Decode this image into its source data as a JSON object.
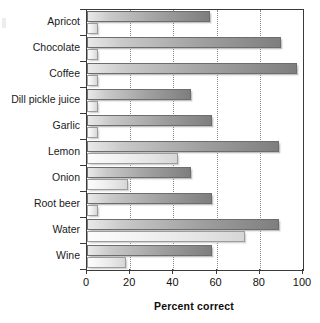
{
  "chart_data": {
    "type": "bar",
    "orientation": "horizontal",
    "title": "",
    "xlabel": "Percent correct",
    "ylabel": "",
    "xlim": [
      0,
      100
    ],
    "xticks": [
      0,
      20,
      40,
      60,
      80,
      100
    ],
    "grid": "vertical-dotted",
    "legend": "none",
    "categories": [
      "Apricot",
      "Chocolate",
      "Coffee",
      "Dill pickle juice",
      "Garlic",
      "Lemon",
      "Onion",
      "Root beer",
      "Water",
      "Wine"
    ],
    "series": [
      {
        "name": "upper-bar",
        "color": "#9f9f9f",
        "values": [
          57,
          90,
          97,
          48,
          58,
          89,
          48,
          58,
          89,
          58
        ]
      },
      {
        "name": "lower-bar",
        "color": "#e8e8e8",
        "values": [
          5,
          5,
          5,
          5,
          5,
          42,
          19,
          5,
          73,
          18
        ]
      }
    ]
  },
  "axis": {
    "tick_labels": [
      "0",
      "20",
      "40",
      "60",
      "80",
      "100"
    ],
    "x_title": "Percent correct"
  },
  "colors": {
    "frame": "#3a3a3a",
    "grid": "#8a8a8a",
    "bar_upper": "#9f9f9f",
    "bar_lower": "#e8e8e8",
    "text": "#1a1a1a"
  }
}
